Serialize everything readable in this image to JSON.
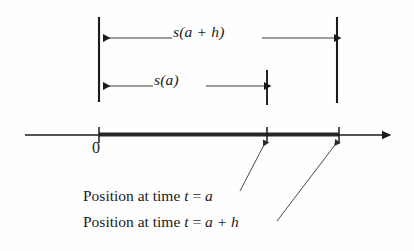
{
  "figure": {
    "background_color": "#fefefe",
    "ink_color": "#1b1b1b",
    "leader_color": "#555555"
  },
  "dimensions": [
    {
      "name": "s(a+h)",
      "label": "s(a + h)",
      "label_parts": {
        "func": "s",
        "open": "(",
        "arg1": "a",
        "op": " + ",
        "arg2": "h",
        "close": ")"
      },
      "y": 38,
      "x_start": 99,
      "x_end": 337
    },
    {
      "name": "s(a)",
      "label": "s(a)",
      "label_parts": {
        "func": "s",
        "open": "(",
        "arg1": "a",
        "close": ")"
      },
      "y": 86,
      "x_start": 99,
      "x_end": 267
    }
  ],
  "extension_bars": [
    {
      "name": "left-bar",
      "x": 99,
      "y_top": 17,
      "y_bottom": 102
    },
    {
      "name": "middle-bar",
      "x": 267,
      "y_top": 70,
      "y_bottom": 105
    },
    {
      "name": "right-bar",
      "x": 337,
      "y_top": 17,
      "y_bottom": 103
    }
  ],
  "number_line": {
    "y": 135,
    "x_start": 25,
    "x_end": 392,
    "arrow_at": "right",
    "highlight_segment": {
      "x_start": 99,
      "x_end": 339,
      "thickness": 4
    },
    "ticks": [
      {
        "name": "tick-zero",
        "x": 99,
        "label": "0"
      },
      {
        "name": "tick-position-a",
        "x": 267,
        "label": ""
      },
      {
        "name": "tick-position-a-plus-h",
        "x": 339,
        "label": ""
      }
    ]
  },
  "callouts": [
    {
      "name": "position-at-time-a",
      "text": "Position at time t = a",
      "text_prefix": "Position at time ",
      "var_t": "t",
      "equals": " = ",
      "value": "a",
      "leader": {
        "from_x": 240,
        "from_y": 191,
        "to_x": 266,
        "to_y": 141
      }
    },
    {
      "name": "position-at-time-a-plus-h",
      "text": "Position at time t = a + h",
      "text_prefix": "Position at time ",
      "var_t": "t",
      "equals": " = ",
      "value": "a + h",
      "leader": {
        "from_x": 277,
        "from_y": 221,
        "to_x": 338,
        "to_y": 141
      }
    }
  ]
}
